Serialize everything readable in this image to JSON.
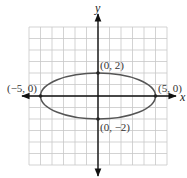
{
  "chart_data": {
    "type": "line",
    "title": "",
    "xlabel": "x",
    "ylabel": "y",
    "xlim": [
      -6,
      6
    ],
    "ylim": [
      -6,
      6
    ],
    "grid": true,
    "curve": {
      "shape": "ellipse",
      "equation": "x^2/25 + y^2/4 = 1",
      "center": [
        0,
        0
      ],
      "semi_major": 5,
      "semi_minor": 2
    },
    "points": [
      {
        "x": 0,
        "y": 2,
        "label": "(0, 2)"
      },
      {
        "x": 0,
        "y": -2,
        "label": "(0, −2)"
      },
      {
        "x": -5,
        "y": 0,
        "label": "(−5, 0)"
      },
      {
        "x": 5,
        "y": 0,
        "label": "(5, 0)"
      }
    ]
  },
  "labels": {
    "x_axis": "x",
    "y_axis": "y",
    "top": "(0, 2)",
    "bottom": "(0, −2)",
    "left": "(−5, 0)",
    "right": "(5, 0)"
  },
  "colors": {
    "grid": "#c8c8c8",
    "axis": "#111111",
    "curve": "#555555",
    "point": "#222222"
  }
}
